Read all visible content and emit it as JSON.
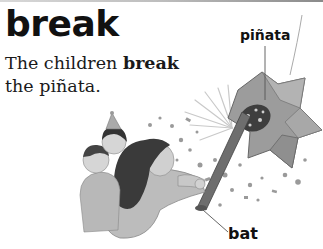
{
  "entry": {
    "headword": "break",
    "sentence": {
      "before": "The children ",
      "bold": "break",
      "after": " the piñata."
    }
  },
  "illustration": {
    "description": "Children at a party; a girl swings a bat at a star-shaped piñata that bursts with candy and confetti",
    "labels": [
      {
        "text": "piñata",
        "target": "pinata"
      },
      {
        "text": "bat",
        "target": "bat"
      }
    ]
  },
  "colors": {
    "text": "#111111",
    "top_rule_start": "#d8d8d8",
    "top_rule_end": "#8a8a8a"
  }
}
